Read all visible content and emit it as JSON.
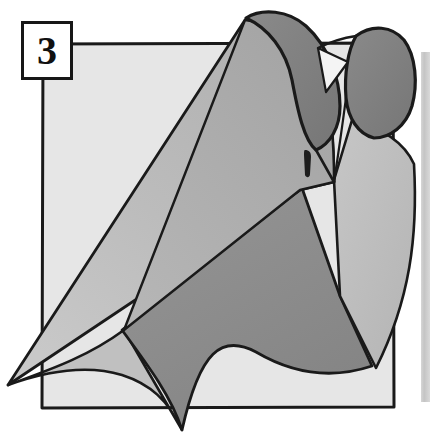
{
  "figure": {
    "step_number": "3",
    "caption": "",
    "background_color": "#ffffff"
  },
  "palette": {
    "outline": "#1a1a1a",
    "paper_light": "#e4e4e4",
    "cloth_mid": "#b2b2b2",
    "cloth_light": "#c3c3c3",
    "cloth_dark": "#8d8d8d",
    "roll_interior": "#7e7e7e",
    "page_edge_band": "#c9c9c9",
    "number_box_fill": "#ffffff",
    "number_box_border": "#171717",
    "number_text": "#111111"
  },
  "shapes": {
    "base_square": {
      "name": "background-square",
      "fill": "#e4e4e4",
      "points": "42,43 394,43 394,408 42,408"
    },
    "page_edge_band": {
      "name": "page-edge-band",
      "fill": "#c9c9c9",
      "points": "421,52 430,52 430,400 421,400"
    },
    "large_cone": {
      "name": "rolled-cone-front",
      "fill": "#c3c3c3",
      "points": "8,385 243,18 318,60 332,178 300,186 120,330"
    },
    "cone_highlight": {
      "name": "cone-highlight-face",
      "fill": "#b2b2b2",
      "points": "243,18 318,62 332,178 300,187 128,318"
    },
    "cone_roll_left": {
      "name": "roll-opening-left",
      "fill": "#7e7e7e",
      "points": "243,18 268,14 300,22 330,48 340,95 330,132 312,148 298,120 290,70 262,33"
    },
    "cone_roll_right": {
      "name": "roll-opening-right",
      "fill": "#7e7e7e",
      "points": "358,34 380,28 400,40 412,66 410,100 396,124 372,136 352,120 344,92 346,58"
    },
    "right_flap": {
      "name": "right-side-flap",
      "fill": "#c3c3c3",
      "points": "332,178 352,120 400,130 412,160 404,300 370,365 340,300"
    },
    "lower_dark_drape": {
      "name": "lower-dark-drape",
      "fill": "#8d8d8d",
      "points": "300,186 340,300 370,365 332,385 250,360 200,390 180,432 140,380 120,330"
    },
    "lower_light_drape": {
      "name": "lower-light-drape",
      "fill": "#b2b2b2",
      "points": "120,330 180,432 160,390 100,362 40,372 8,385"
    },
    "fold_mark": {
      "name": "fold-slit-mark",
      "fill": "#1e1e1e",
      "points": "304,150 310,150 311,176 305,176"
    }
  },
  "labels": {
    "step_box": "3"
  }
}
